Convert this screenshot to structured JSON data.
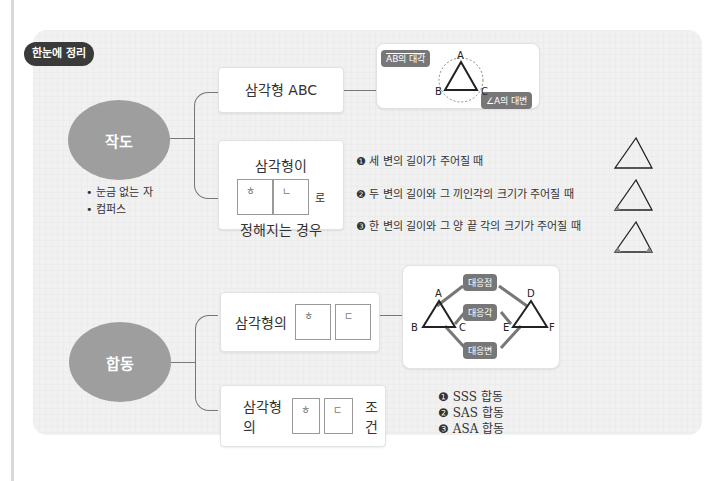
{
  "badge": "한눈에 정리",
  "section1": {
    "title": "작도",
    "tools": [
      "• 눈금 없는 자",
      "• 컴퍼스"
    ],
    "box1": {
      "label": "삼각형 ABC"
    },
    "diagram1": {
      "tag_top": "AB의 대각",
      "tag_bottom": "∠A의 대변",
      "vertices": [
        "A",
        "B",
        "C"
      ],
      "sides": [
        "a",
        "b",
        "c"
      ]
    },
    "box2": {
      "line1": "삼각형이",
      "sq1": "ㅎ",
      "sq2": "ㄴ",
      "suffix": "로",
      "line2": "정해지는 경우"
    },
    "conditions": [
      "❶ 세 변의 길이가 주어질 때",
      "❷ 두 변의 길이와 그 끼인각의 크기가 주어질 때",
      "❸ 한 변의 길이와 그 양 끝 각의 크기가 주어질 때"
    ]
  },
  "section2": {
    "title": "합동",
    "box1": {
      "prefix": "삼각형의",
      "sq1": "ㅎ",
      "sq2": "ㄷ"
    },
    "diagram2": {
      "tags": [
        "대응점",
        "대응각",
        "대응변"
      ],
      "vertices": [
        "A",
        "B",
        "C",
        "D",
        "E",
        "F"
      ]
    },
    "box2": {
      "prefix": "삼각형의",
      "sq1": "ㅎ",
      "sq2": "ㄷ",
      "suffix": "조건"
    },
    "conditions": [
      "❶ SSS 합동",
      "❷ SAS 합동",
      "❸ ASA 합동"
    ]
  }
}
